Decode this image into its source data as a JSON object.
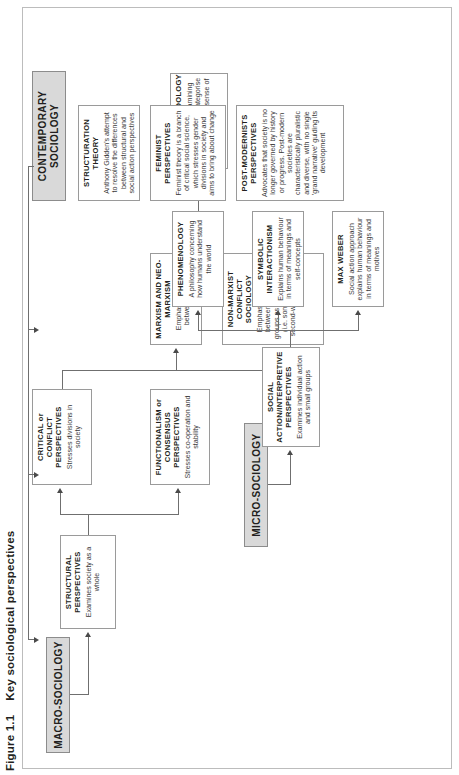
{
  "figure": {
    "number": "Figure 1.1",
    "title": "Key sociological perspectives"
  },
  "sections": {
    "macro": {
      "label": "MACRO-SOCIOLOGY"
    },
    "micro": {
      "label": "MICRO-SOCIOLOGY"
    },
    "contemporary": {
      "label": "CONTEMPORARY\nSOCIOLOGY"
    }
  },
  "boxes": {
    "structural": {
      "heading": "STRUCTURAL PERSPECTIVES",
      "body": "Examines society as a whole"
    },
    "functionalism": {
      "heading": "FUNCTIONALISM or CONSENSUS PERSPECTIVES",
      "body": "Stresses co-operation and stability"
    },
    "conflict": {
      "heading": "CRITICAL or CONFLICT PERSPECTIVES",
      "body": "Stresses divisions in society"
    },
    "marxism": {
      "heading": "MARXISM AND NEO-MARXISM",
      "body": "Emphasizes conflict between classes"
    },
    "nonmarxist": {
      "heading": "NON-MARXIST CONFLICT SOCIOLOGY",
      "body": "Emphasises conflicts between many social groups as well as classes (i.e. some variants of second-wave feminism)"
    },
    "socialaction": {
      "heading": "SOCIAL ACTION/INTERPRETIVE PERSPECTIVES",
      "body": "Examines individual action and small groups"
    },
    "weber": {
      "heading": "MAX WEBER",
      "body": "Social action approach explains human behaviour in terms of meanings and motives"
    },
    "symbolic": {
      "heading": "SYMBOLIC INTERACTIONISM",
      "body": "Explains human behaviour in terms of meanings and self-concepts"
    },
    "phenomenology": {
      "heading": "PHENOMENOLOGY",
      "body": "A philosophy concerning how humans understand the world"
    },
    "ethnomethodology": {
      "heading": "ETHNOMETHODOLOGY",
      "body": "A perspective examining the way humans categorise the world to make sense of social life"
    },
    "structuration": {
      "heading": "STRUCTURATION THEORY",
      "body": "Anthony Gidden's attempt to resolve the differences between structural and social action perspectives"
    },
    "feminist": {
      "heading": "FEMINIST PERSPECTIVES",
      "body": "Feminist theory is a branch of critical social science, which stresses gender divisions in society and aims to bring about change"
    },
    "postmodern": {
      "heading": "POST-MODERNISTS PERSPECTIVES",
      "body": "Advocates that society is no longer governed by history or progress. Post-modern societies are characteristically pluralistic and diverse, with no single 'grand narrative' guiding its development"
    }
  },
  "colors": {
    "header_fill": "#d9d9d9",
    "box_border": "#9a9a9a",
    "connector": "#6f6f6f",
    "text": "#231f20"
  }
}
